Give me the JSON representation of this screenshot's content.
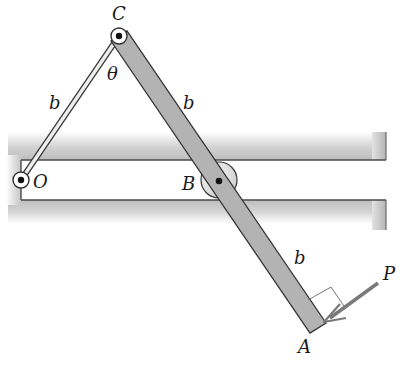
{
  "diagram": {
    "type": "mechanism",
    "labels": {
      "C": "C",
      "O": "O",
      "B": "B",
      "A": "A",
      "P": "P",
      "theta": "θ",
      "b_link_OC": "b",
      "b_CB": "b",
      "b_BA": "b"
    },
    "points": {
      "C": [
        119,
        36
      ],
      "O": [
        21,
        180
      ],
      "B": [
        219,
        180
      ],
      "A": [
        318,
        328
      ]
    },
    "colors": {
      "bar_fill": "#b3b3b3",
      "bar_stroke": "#3a3a3a",
      "guide_shadow": "#c8c8c8",
      "link_fill": "#e6e6e6",
      "pin_ring": "#ffffff",
      "pin_dot": "#111111",
      "text": "#1a1a1a",
      "arrow": "#777777"
    }
  }
}
